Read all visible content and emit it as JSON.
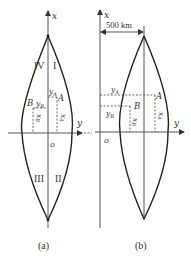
{
  "figure_a": {
    "caption": "(a)",
    "x_axis_label": "x",
    "y_axis_label": "y",
    "origin_label": "o",
    "quadrants": {
      "q1": "I",
      "q2": "II",
      "q3": "III",
      "q4": "IV"
    },
    "point_a": {
      "label": "A",
      "y_label": "y",
      "y_sub": "A",
      "x_label": "x",
      "x_sub": "A"
    },
    "point_b": {
      "label": "B",
      "y_label": "y",
      "y_sub": "B",
      "x_label": "x",
      "x_sub": "B"
    }
  },
  "figure_b": {
    "caption": "(b)",
    "x_axis_label": "x",
    "y_axis_label": "y",
    "origin_label": "o",
    "distance_label": "500 km",
    "point_a": {
      "label": "A",
      "y_label": "y",
      "y_sub": "A",
      "x_label": "x",
      "x_sub": "A"
    },
    "point_b": {
      "label": "B",
      "y_label": "y",
      "y_sub": "B",
      "x_label": "x",
      "x_sub": "B"
    }
  },
  "colors": {
    "line": "#222222",
    "axis": "#555555",
    "background": "#ffffff"
  }
}
